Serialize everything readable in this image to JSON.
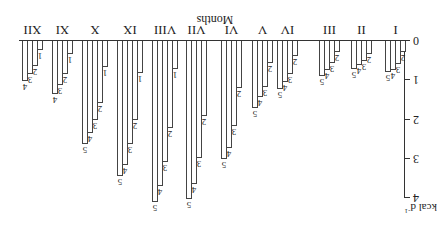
{
  "chart_data": {
    "type": "bar",
    "orientation_note": "figure rendered rotated 180 degrees",
    "title": "",
    "xlabel": "Months",
    "ylabel": "kcal d-1",
    "ylim": [
      0,
      4
    ],
    "yticks": [
      "0",
      "1",
      "2",
      "3",
      "4"
    ],
    "categories": [
      "I",
      "II",
      "III",
      "IV",
      "V",
      "VI",
      "VII",
      "VIII",
      "IX",
      "X",
      "XI",
      "XII"
    ],
    "series": [
      {
        "name": "1",
        "values": [
          null,
          null,
          null,
          null,
          null,
          null,
          null,
          0.7,
          0.81,
          0.65,
          0.32,
          0.24
        ]
      },
      {
        "name": "2",
        "values": [
          0.29,
          0.33,
          0.29,
          0.37,
          0.56,
          1.19,
          1.91,
          2.22,
          2.0,
          1.57,
          0.83,
          0.63
        ]
      },
      {
        "name": "3",
        "values": [
          0.58,
          0.52,
          0.56,
          0.84,
          1.16,
          2.17,
          2.97,
          3.09,
          2.63,
          2.0,
          1.13,
          0.83
        ]
      },
      {
        "name": "4",
        "values": [
          0.75,
          0.61,
          0.74,
          1.04,
          1.43,
          2.71,
          3.63,
          3.7,
          3.16,
          2.35,
          1.35,
          1.02
        ]
      },
      {
        "name": "5",
        "values": [
          0.8,
          0.7,
          0.89,
          1.22,
          1.71,
          2.99,
          4.02,
          4.1,
          3.44,
          2.61,
          null,
          null
        ]
      }
    ],
    "grid": false,
    "legend": "bar labels 1-5 printed at bar tips"
  },
  "axis": {
    "y_title": "kcal d",
    "y_title_sup": "-1",
    "x_title": "Months"
  }
}
